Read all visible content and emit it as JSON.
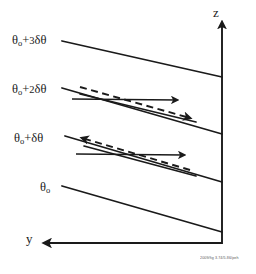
{
  "figure": {
    "width": 256,
    "height": 274,
    "background": "#ffffff",
    "ink_color": "#1a1a1a",
    "credit": "2009/fig 3.74/5.86/peh"
  },
  "axes": {
    "vertical": {
      "name": "z-axis",
      "label": "z",
      "label_x": 213,
      "label_y": 6,
      "direction": "up",
      "x": 222,
      "y_top": 22,
      "y_bottom": 244
    },
    "horizontal": {
      "name": "y-axis",
      "label": "y",
      "label_x": 26,
      "label_y": 232,
      "direction": "left",
      "y": 243,
      "x_left": 44,
      "x_right": 222
    }
  },
  "isentropes": [
    {
      "name": "isentrope-theta0-plus-3dtheta",
      "label_base": "θ",
      "label_sub": "o",
      "label_rest_num": "3",
      "label_rest": "δθ",
      "label_plus": "+",
      "label_full": "θo+3δθ",
      "label_x": 12,
      "label_y": 34,
      "x1": 62,
      "y1": 41,
      "x2": 222,
      "y2": 77
    },
    {
      "name": "isentrope-theta0-plus-2dtheta",
      "label_base": "θ",
      "label_sub": "o",
      "label_rest_num": "2",
      "label_rest": "δθ",
      "label_plus": "+",
      "label_full": "θo+2δθ",
      "label_x": 12,
      "label_y": 83,
      "x1": 62,
      "y1": 88,
      "x2": 222,
      "y2": 134
    },
    {
      "name": "isentrope-theta0-plus-dtheta",
      "label_base": "θ",
      "label_sub": "o",
      "label_rest_num": "",
      "label_rest": "δθ",
      "label_plus": "+",
      "label_full": "θo+δθ",
      "label_x": 14,
      "label_y": 132,
      "x1": 65,
      "y1": 136,
      "x2": 222,
      "y2": 182
    },
    {
      "name": "isentrope-theta0",
      "label_base": "θ",
      "label_sub": "o",
      "label_rest_num": "",
      "label_rest": "",
      "label_plus": "",
      "label_full": "θo",
      "label_x": 40,
      "label_y": 181,
      "x1": 62,
      "y1": 186,
      "x2": 222,
      "y2": 232
    }
  ],
  "annotations": {
    "upper_cluster": {
      "name": "upper-perturbation-cluster",
      "description": "dashed perturbed isentrope with leftward arrowhead crossing a solid rightward velocity arrow above the theta0+2dtheta surface",
      "dashed_line": {
        "x1": 80,
        "y1": 87,
        "x2": 190,
        "y2": 118
      },
      "dashed_arrow_dir": "left",
      "solid_arrow_right": {
        "x1": 72,
        "y1": 99,
        "x2": 177,
        "y2": 100
      },
      "solid_tilt_line": {
        "x1": 80,
        "y1": 94,
        "x2": 196,
        "y2": 122
      }
    },
    "lower_cluster": {
      "name": "lower-perturbation-cluster",
      "description": "dashed perturbed isentrope with leftward arrowhead crossing a solid leftward velocity arrow below the theta0+dtheta surface",
      "dashed_line": {
        "x1": 82,
        "y1": 138,
        "x2": 190,
        "y2": 170
      },
      "dashed_arrow_dir": "left",
      "solid_arrow_left": {
        "x1": 76,
        "y1": 154,
        "x2": 184,
        "y2": 155
      },
      "solid_tilt_line": {
        "x1": 84,
        "y1": 146,
        "x2": 196,
        "y2": 176
      }
    }
  }
}
